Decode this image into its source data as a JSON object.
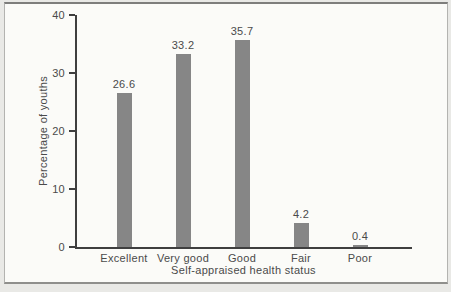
{
  "chart_data": {
    "type": "bar",
    "categories": [
      "Excellent",
      "Very good",
      "Good",
      "Fair",
      "Poor"
    ],
    "values": [
      26.6,
      33.2,
      35.7,
      4.2,
      0.4
    ],
    "value_labels": [
      "26.6",
      "33.2",
      "35.7",
      "4.2",
      "0.4"
    ],
    "title": "",
    "xlabel": "Self-appraised health status",
    "ylabel": "Percentage of youths",
    "ylim": [
      0,
      40
    ],
    "yticks": [
      0,
      10,
      20,
      30,
      40
    ],
    "grid": false,
    "legend_position": "none",
    "colors": {
      "bar": "#868686",
      "axis": "#3f3f3f",
      "text": "#4a4a4a",
      "plot_background": "#fbfbf8",
      "page_background": "#e9e9e6",
      "frame_border": "#b3b3b0"
    }
  }
}
